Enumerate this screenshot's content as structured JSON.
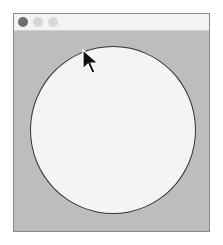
{
  "window": {
    "title": "",
    "controls": [
      "close",
      "minimize",
      "maximize"
    ]
  },
  "canvas": {
    "background": "#bdbdbd",
    "shape": {
      "type": "circle",
      "fill": "#f4f4f4",
      "stroke": "#333333"
    }
  },
  "cursor": {
    "icon": "arrow-cursor-icon",
    "x": 83,
    "y": 50
  }
}
